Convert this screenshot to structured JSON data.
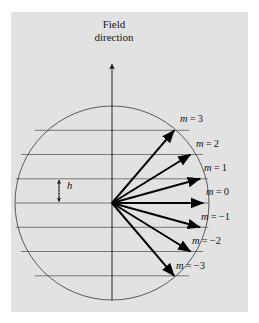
{
  "figure": {
    "title_lines": [
      "Field",
      "direction"
    ],
    "axis_label": "Field direction",
    "spacing_label": "h",
    "background_color": "#e2e2e2",
    "line_color": "#4a4a4a",
    "vector_color": "#000000",
    "text_color": "#141414"
  },
  "circle": {
    "center_x": 112,
    "center_y": 203,
    "radius": 97
  },
  "chart_data": {
    "type": "scatter",
    "title": "Field direction",
    "xlabel": "",
    "ylabel": "",
    "quantum_number_symbol": "m",
    "spacing_symbol": "h",
    "spacing_px": 24.25,
    "categories": [
      "m = 3",
      "m = 2",
      "m = 1",
      "m = 0",
      "m = -1",
      "m = -2",
      "m = -3"
    ],
    "values": [
      3,
      2,
      1,
      0,
      -1,
      -2,
      -3
    ],
    "vectors": [
      {
        "m": 3,
        "label": "m = 3",
        "tip_x": 174.2,
        "tip_y": 130.3,
        "label_x": 180,
        "label_y": 118
      },
      {
        "m": 2,
        "label": "m = 2",
        "tip_x": 190.6,
        "tip_y": 154.5,
        "label_x": 196,
        "label_y": 143
      },
      {
        "m": 1,
        "label": "m = 1",
        "tip_x": 200.1,
        "tip_y": 178.8,
        "label_x": 204,
        "label_y": 167
      },
      {
        "m": 0,
        "label": "m = 0",
        "tip_x": 203.3,
        "tip_y": 203.0,
        "label_x": 206,
        "label_y": 192
      },
      {
        "m": -1,
        "label": "m = -1",
        "tip_x": 200.1,
        "tip_y": 227.3,
        "label_x": 201,
        "label_y": 216
      },
      {
        "m": -2,
        "label": "m = -2",
        "tip_x": 190.6,
        "tip_y": 251.5,
        "label_x": 192,
        "label_y": 241
      },
      {
        "m": -3,
        "label": "m = -3",
        "tip_x": 174.2,
        "tip_y": 275.8,
        "label_x": 176,
        "label_y": 265
      }
    ],
    "gridlines_y": [
      130.3,
      154.5,
      178.8,
      203.0,
      227.3,
      251.5,
      275.8
    ],
    "grid": true,
    "legend": "none"
  }
}
